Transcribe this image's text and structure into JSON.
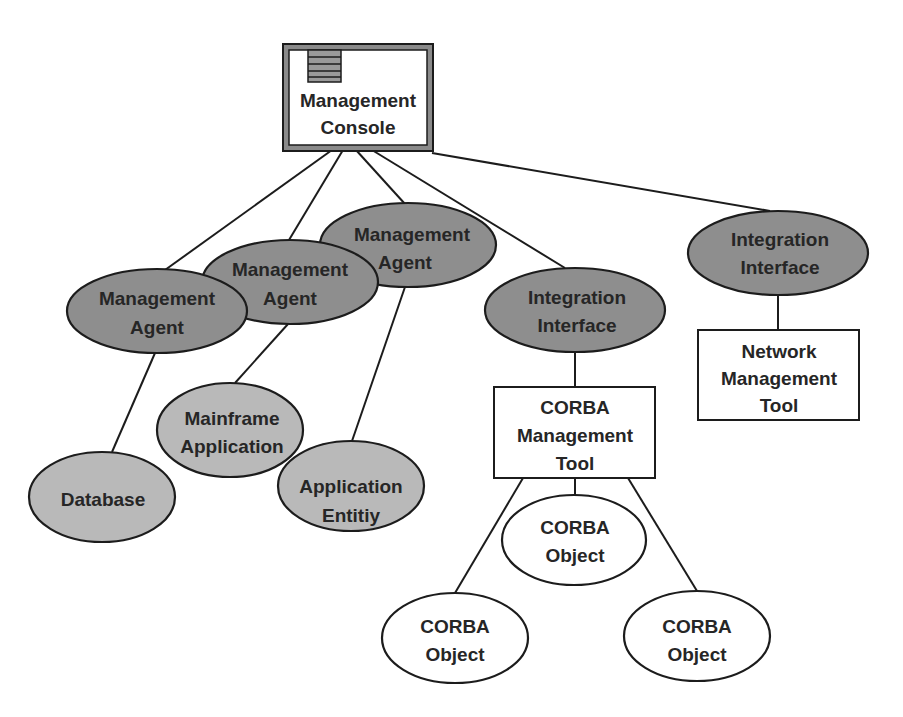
{
  "diagram": {
    "colors": {
      "agent_fill": "#8e8e8e",
      "resource_fill": "#b9b9b9",
      "object_fill": "#ffffff",
      "stroke": "#1c1c1c",
      "text": "#262626"
    },
    "console": {
      "line1": "Management",
      "line2": "Console",
      "icon": "menu-list-icon"
    },
    "agents": [
      {
        "line1": "Management",
        "line2": "Agent"
      },
      {
        "line1": "Management",
        "line2": "Agent"
      },
      {
        "line1": "Management",
        "line2": "Agent"
      }
    ],
    "integration_interfaces": [
      {
        "line1": "Integration",
        "line2": "Interface"
      },
      {
        "line1": "Integration",
        "line2": "Interface"
      }
    ],
    "resources": {
      "database": {
        "line1": "Database"
      },
      "mainframe": {
        "line1": "Mainframe",
        "line2": "Application"
      },
      "app_entity": {
        "line1": "Application",
        "line2": "Entitiy"
      }
    },
    "corba_tool": {
      "line1": "CORBA",
      "line2": "Management",
      "line3": "Tool"
    },
    "network_tool": {
      "line1": "Network",
      "line2": "Management",
      "line3": "Tool"
    },
    "corba_objects": [
      {
        "line1": "CORBA",
        "line2": "Object"
      },
      {
        "line1": "CORBA",
        "line2": "Object"
      },
      {
        "line1": "CORBA",
        "line2": "Object"
      }
    ]
  }
}
